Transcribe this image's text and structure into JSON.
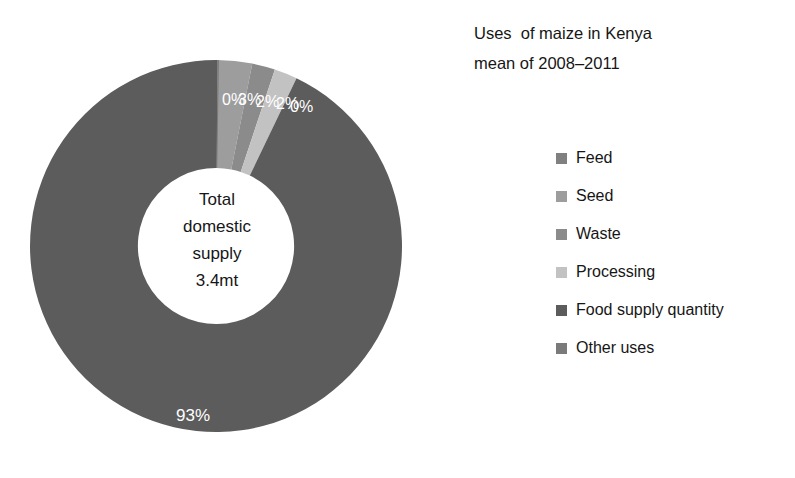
{
  "title": {
    "line1": "Uses  of maize in Kenya",
    "line2": "mean of 2008–2011"
  },
  "center": {
    "line1": "Total",
    "line2": "domestic",
    "line3": "supply",
    "line4": "3.4mt"
  },
  "legend": {
    "items": [
      {
        "label": "Feed",
        "color": "#808080"
      },
      {
        "label": "Seed",
        "color": "#9d9d9d"
      },
      {
        "label": "Waste",
        "color": "#8b8b8b"
      },
      {
        "label": "Processing",
        "color": "#c2c2c2"
      },
      {
        "label": "Food supply quantity",
        "color": "#5c5c5c"
      },
      {
        "label": "Other uses",
        "color": "#7a7a7a"
      }
    ]
  },
  "chart_data": {
    "type": "pie",
    "variant": "donut",
    "title": "Uses  of maize in Kenya mean of 2008–2011",
    "center_label": "Total domestic supply 3.4mt",
    "total": "3.4mt",
    "start_angle_deg": 0,
    "direction": "clockwise",
    "hole_ratio": 0.42,
    "legend_position": "right",
    "labels": [
      "Feed",
      "Seed",
      "Waste",
      "Processing",
      "Food supply quantity",
      "Other uses"
    ],
    "values": [
      0,
      3,
      2,
      2,
      93,
      0
    ],
    "value_labels": [
      "0%",
      "3%",
      "2%",
      "2%",
      "93%",
      "0%"
    ],
    "colors": [
      "#808080",
      "#9d9d9d",
      "#8b8b8b",
      "#c2c2c2",
      "#5c5c5c",
      "#7a7a7a"
    ],
    "slices": [
      {
        "label": "Feed",
        "value": 0,
        "display": "0%",
        "color": "#808080"
      },
      {
        "label": "Seed",
        "value": 3,
        "display": "3%",
        "color": "#9d9d9d"
      },
      {
        "label": "Waste",
        "value": 2,
        "display": "2%",
        "color": "#8b8b8b"
      },
      {
        "label": "Processing",
        "value": 2,
        "display": "2%",
        "color": "#c2c2c2"
      },
      {
        "label": "Food supply quantity",
        "value": 93,
        "display": "93%",
        "color": "#5c5c5c"
      },
      {
        "label": "Other uses",
        "value": 0,
        "display": "0%",
        "color": "#7a7a7a"
      }
    ],
    "slice_label_positions": [
      {
        "display": "0%",
        "x": 194,
        "y": 47
      },
      {
        "display": "3%",
        "x": 210,
        "y": 47
      },
      {
        "display": "2%",
        "x": 228,
        "y": 49
      },
      {
        "display": "2%",
        "x": 248,
        "y": 51
      },
      {
        "display": "0%",
        "x": 262,
        "y": 54
      },
      {
        "display": "93%",
        "x": 148,
        "y": 363
      }
    ]
  }
}
